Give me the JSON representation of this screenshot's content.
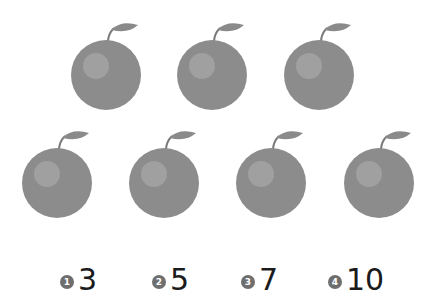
{
  "question": {
    "apple_count": 7,
    "rows": [
      3,
      4
    ],
    "apple_color": "#8e8e8e"
  },
  "options": [
    {
      "badge": "1",
      "value": "3"
    },
    {
      "badge": "2",
      "value": "5"
    },
    {
      "badge": "3",
      "value": "7"
    },
    {
      "badge": "4",
      "value": "10"
    }
  ]
}
